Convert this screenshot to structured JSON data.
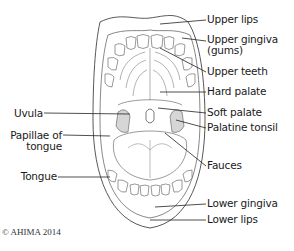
{
  "diagram": {
    "labels_right": [
      {
        "id": "upper-lips",
        "text": "Upper lips"
      },
      {
        "id": "upper-gingiva",
        "text": "Upper gingiva",
        "text2": "(gums)"
      },
      {
        "id": "upper-teeth",
        "text": "Upper teeth"
      },
      {
        "id": "hard-palate",
        "text": "Hard palate"
      },
      {
        "id": "soft-palate",
        "text": "Soft palate"
      },
      {
        "id": "palatine-tonsil",
        "text": "Palatine tonsil"
      },
      {
        "id": "fauces",
        "text": "Fauces"
      },
      {
        "id": "lower-gingiva",
        "text": "Lower gingiva"
      },
      {
        "id": "lower-lips",
        "text": "Lower lips"
      }
    ],
    "labels_left": [
      {
        "id": "uvula",
        "text": "Uvula"
      },
      {
        "id": "papillae",
        "text": "Papillae of",
        "text2": "tongue"
      },
      {
        "id": "tongue",
        "text": "Tongue"
      }
    ],
    "copyright": "© AHIMA 2014",
    "colors": {
      "line": "#444444",
      "text": "#1a1a1a",
      "tonsil": "#cccccc"
    }
  }
}
